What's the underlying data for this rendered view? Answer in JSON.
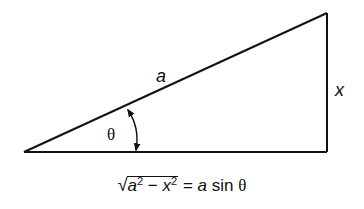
{
  "diagram": {
    "type": "right-triangle",
    "vertices": {
      "left": [
        24,
        152
      ],
      "bottom_right": [
        327,
        152
      ],
      "top_right": [
        327,
        13
      ]
    },
    "labels": {
      "hypotenuse": "a",
      "opposite": "x",
      "angle": "θ"
    },
    "angle_arrow": "double-headed-arc",
    "stroke_color": "#111111"
  },
  "formula": {
    "radicand_a": "a",
    "radicand_a_exp": "2",
    "minus": "−",
    "radicand_x": "x",
    "radicand_x_exp": "2",
    "equals": "=",
    "rhs_a": "a",
    "rhs_fn": "sin",
    "rhs_theta": "θ",
    "full_text": "√(a² − x²) = a sin θ"
  }
}
